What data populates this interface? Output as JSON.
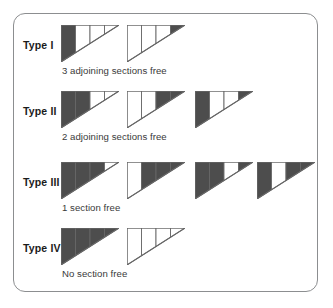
{
  "figure": {
    "panel_border_color": "#8c8e90",
    "background_color": "#ffffff",
    "fill_dark_color": "#4d4d4d",
    "fill_light_color": "#ffffff",
    "outline_color": "#666666",
    "rows": [
      {
        "label": "Type I",
        "caption": "3 adjoining sections free",
        "diagrams": [
          {
            "sections": [
              "dark",
              "light",
              "light",
              "light"
            ]
          },
          {
            "sections": [
              "light",
              "light",
              "light",
              "dark"
            ]
          }
        ]
      },
      {
        "label": "Type II",
        "caption": "2 adjoining sections free",
        "diagrams": [
          {
            "sections": [
              "dark",
              "dark",
              "light",
              "light"
            ]
          },
          {
            "sections": [
              "light",
              "light",
              "dark",
              "dark"
            ]
          },
          {
            "sections": [
              "dark",
              "light",
              "light",
              "dark"
            ]
          }
        ]
      },
      {
        "label": "Type III",
        "caption": "1 section free",
        "diagrams": [
          {
            "sections": [
              "dark",
              "dark",
              "dark",
              "light"
            ]
          },
          {
            "sections": [
              "light",
              "dark",
              "dark",
              "dark"
            ]
          },
          {
            "sections": [
              "dark",
              "dark",
              "light",
              "dark"
            ]
          },
          {
            "sections": [
              "dark",
              "light",
              "dark",
              "dark"
            ]
          }
        ]
      },
      {
        "label": "Type IV",
        "caption": "No section free",
        "diagrams": [
          {
            "sections": [
              "dark",
              "dark",
              "dark",
              "dark"
            ]
          },
          {
            "sections": [
              "light",
              "light",
              "light",
              "light"
            ]
          }
        ]
      }
    ]
  }
}
